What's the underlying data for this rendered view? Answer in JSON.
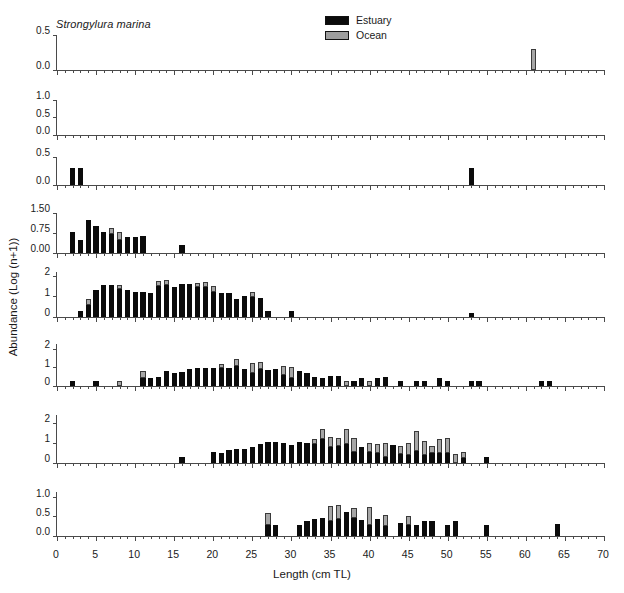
{
  "figure": {
    "species": "Strongylura marina",
    "yaxis_title": "Abundance (Log (n+1))",
    "xaxis_title": "Length (cm TL)",
    "colors": {
      "estuary": "#0b0b0b",
      "ocean": "#a6a6a6",
      "axis": "#4a4a4a"
    }
  },
  "legend": {
    "position": "top-center",
    "entries": [
      {
        "label": "Estuary",
        "icon": "filled-square-black-swatch"
      },
      {
        "label": "Ocean",
        "icon": "filled-square-gray-swatch"
      }
    ]
  },
  "xaxis": {
    "min": 0,
    "max": 70,
    "major_step": 5,
    "minor_step": 1,
    "ticks": [
      "0",
      "5",
      "10",
      "15",
      "20",
      "25",
      "30",
      "35",
      "40",
      "45",
      "50",
      "55",
      "60",
      "65",
      "70"
    ]
  },
  "chart_data": {
    "type": "bar",
    "subtype": "stacked-bar-small-multiples",
    "title": "Strongylura marina",
    "xlabel": "Length (cm TL)",
    "ylabel": "Abundance (Log (n+1))",
    "xlim": [
      0,
      70
    ],
    "grid": false,
    "legend_position": "top-center",
    "series_names": [
      "Estuary",
      "Ocean"
    ],
    "panels": [
      {
        "label": "March (n=1)",
        "month": "March",
        "n": 1,
        "ylim": [
          0,
          0.5
        ],
        "yticks": [
          "0.0",
          "0.5"
        ],
        "ytick_values": [
          0,
          0.5
        ],
        "bars": [
          {
            "x": 61,
            "estuary": 0.0,
            "ocean": 0.3
          }
        ]
      },
      {
        "label": "April (n=0)",
        "month": "April",
        "n": 0,
        "ylim": [
          0,
          1.0
        ],
        "yticks": [
          "0.0",
          "0.5",
          "1.0"
        ],
        "ytick_values": [
          0,
          0.5,
          1.0
        ],
        "bars": []
      },
      {
        "label": "May (n=3)",
        "month": "May",
        "n": 3,
        "ylim": [
          0,
          0.5
        ],
        "yticks": [
          "0.0",
          "0.5"
        ],
        "ytick_values": [
          0,
          0.5
        ],
        "bars": [
          {
            "x": 2,
            "estuary": 0.3,
            "ocean": 0.0
          },
          {
            "x": 3,
            "estuary": 0.3,
            "ocean": 0.0
          },
          {
            "x": 53,
            "estuary": 0.3,
            "ocean": 0.0
          }
        ]
      },
      {
        "label": "June (n=67)",
        "month": "June",
        "n": 67,
        "ylim": [
          0,
          1.5
        ],
        "yticks": [
          "0.00",
          "0.75",
          "1.50"
        ],
        "ytick_values": [
          0,
          0.75,
          1.5
        ],
        "bars": [
          {
            "x": 2,
            "estuary": 0.8,
            "ocean": 0.0
          },
          {
            "x": 3,
            "estuary": 0.48,
            "ocean": 0.0
          },
          {
            "x": 4,
            "estuary": 1.22,
            "ocean": 0.0
          },
          {
            "x": 5,
            "estuary": 1.0,
            "ocean": 0.0
          },
          {
            "x": 6,
            "estuary": 0.8,
            "ocean": 0.0
          },
          {
            "x": 7,
            "estuary": 0.7,
            "ocean": 0.22
          },
          {
            "x": 8,
            "estuary": 0.48,
            "ocean": 0.3
          },
          {
            "x": 9,
            "estuary": 0.6,
            "ocean": 0.0
          },
          {
            "x": 10,
            "estuary": 0.6,
            "ocean": 0.0
          },
          {
            "x": 11,
            "estuary": 0.62,
            "ocean": 0.0
          },
          {
            "x": 16,
            "estuary": 0.3,
            "ocean": 0.0
          }
        ]
      },
      {
        "label": "July (n=452)",
        "month": "July",
        "n": 452,
        "ylim": [
          0,
          2.2
        ],
        "yticks": [
          "0",
          "1",
          "2"
        ],
        "ytick_values": [
          0,
          1,
          2
        ],
        "bars": [
          {
            "x": 3,
            "estuary": 0.3,
            "ocean": 0.0
          },
          {
            "x": 4,
            "estuary": 0.6,
            "ocean": 0.3
          },
          {
            "x": 5,
            "estuary": 1.3,
            "ocean": 0.0
          },
          {
            "x": 6,
            "estuary": 1.55,
            "ocean": 0.0
          },
          {
            "x": 7,
            "estuary": 1.55,
            "ocean": 0.0
          },
          {
            "x": 8,
            "estuary": 1.35,
            "ocean": 0.22
          },
          {
            "x": 9,
            "estuary": 1.3,
            "ocean": 0.0
          },
          {
            "x": 10,
            "estuary": 1.22,
            "ocean": 0.0
          },
          {
            "x": 11,
            "estuary": 1.2,
            "ocean": 0.0
          },
          {
            "x": 12,
            "estuary": 1.15,
            "ocean": 0.0
          },
          {
            "x": 13,
            "estuary": 1.52,
            "ocean": 0.25
          },
          {
            "x": 14,
            "estuary": 1.55,
            "ocean": 0.28
          },
          {
            "x": 15,
            "estuary": 1.45,
            "ocean": 0.0
          },
          {
            "x": 16,
            "estuary": 1.62,
            "ocean": 0.0
          },
          {
            "x": 17,
            "estuary": 1.6,
            "ocean": 0.0
          },
          {
            "x": 18,
            "estuary": 1.48,
            "ocean": 0.2
          },
          {
            "x": 19,
            "estuary": 1.45,
            "ocean": 0.25
          },
          {
            "x": 20,
            "estuary": 1.22,
            "ocean": 0.3
          },
          {
            "x": 21,
            "estuary": 1.18,
            "ocean": 0.0
          },
          {
            "x": 22,
            "estuary": 1.15,
            "ocean": 0.0
          },
          {
            "x": 23,
            "estuary": 0.9,
            "ocean": 0.0
          },
          {
            "x": 24,
            "estuary": 1.05,
            "ocean": 0.0
          },
          {
            "x": 25,
            "estuary": 1.0,
            "ocean": 0.22
          },
          {
            "x": 26,
            "estuary": 0.95,
            "ocean": 0.0
          },
          {
            "x": 27,
            "estuary": 0.3,
            "ocean": 0.0
          },
          {
            "x": 30,
            "estuary": 0.3,
            "ocean": 0.0
          },
          {
            "x": 53,
            "estuary": 0.22,
            "ocean": 0.0
          }
        ]
      },
      {
        "label": "August (n=358)",
        "month": "August",
        "n": 358,
        "ylim": [
          0,
          2.3
        ],
        "yticks": [
          "0",
          "1",
          "2"
        ],
        "ytick_values": [
          0,
          1,
          2
        ],
        "bars": [
          {
            "x": 2,
            "estuary": 0.3,
            "ocean": 0.0
          },
          {
            "x": 5,
            "estuary": 0.3,
            "ocean": 0.0
          },
          {
            "x": 8,
            "estuary": 0.0,
            "ocean": 0.3
          },
          {
            "x": 11,
            "estuary": 0.42,
            "ocean": 0.38
          },
          {
            "x": 12,
            "estuary": 0.45,
            "ocean": 0.0
          },
          {
            "x": 13,
            "estuary": 0.48,
            "ocean": 0.0
          },
          {
            "x": 14,
            "estuary": 0.8,
            "ocean": 0.0
          },
          {
            "x": 15,
            "estuary": 0.72,
            "ocean": 0.0
          },
          {
            "x": 16,
            "estuary": 0.75,
            "ocean": 0.0
          },
          {
            "x": 17,
            "estuary": 0.95,
            "ocean": 0.0
          },
          {
            "x": 18,
            "estuary": 1.0,
            "ocean": 0.0
          },
          {
            "x": 19,
            "estuary": 1.0,
            "ocean": 0.0
          },
          {
            "x": 20,
            "estuary": 1.0,
            "ocean": 0.0
          },
          {
            "x": 21,
            "estuary": 1.0,
            "ocean": 0.22
          },
          {
            "x": 22,
            "estuary": 1.0,
            "ocean": 0.0
          },
          {
            "x": 23,
            "estuary": 1.12,
            "ocean": 0.35
          },
          {
            "x": 24,
            "estuary": 0.95,
            "ocean": 0.0
          },
          {
            "x": 25,
            "estuary": 0.72,
            "ocean": 0.52
          },
          {
            "x": 26,
            "estuary": 0.92,
            "ocean": 0.4
          },
          {
            "x": 27,
            "estuary": 0.9,
            "ocean": 0.0
          },
          {
            "x": 28,
            "estuary": 0.95,
            "ocean": 0.0
          },
          {
            "x": 29,
            "estuary": 0.6,
            "ocean": 0.48
          },
          {
            "x": 30,
            "estuary": 0.45,
            "ocean": 0.6
          },
          {
            "x": 31,
            "estuary": 0.8,
            "ocean": 0.0
          },
          {
            "x": 32,
            "estuary": 0.7,
            "ocean": 0.0
          },
          {
            "x": 33,
            "estuary": 0.52,
            "ocean": 0.0
          },
          {
            "x": 34,
            "estuary": 0.42,
            "ocean": 0.0
          },
          {
            "x": 35,
            "estuary": 0.55,
            "ocean": 0.0
          },
          {
            "x": 36,
            "estuary": 0.55,
            "ocean": 0.0
          },
          {
            "x": 37,
            "estuary": 0.0,
            "ocean": 0.3
          },
          {
            "x": 38,
            "estuary": 0.3,
            "ocean": 0.0
          },
          {
            "x": 39,
            "estuary": 0.45,
            "ocean": 0.0
          },
          {
            "x": 40,
            "estuary": 0.0,
            "ocean": 0.3
          },
          {
            "x": 41,
            "estuary": 0.45,
            "ocean": 0.0
          },
          {
            "x": 42,
            "estuary": 0.48,
            "ocean": 0.0
          },
          {
            "x": 44,
            "estuary": 0.3,
            "ocean": 0.0
          },
          {
            "x": 46,
            "estuary": 0.3,
            "ocean": 0.0
          },
          {
            "x": 47,
            "estuary": 0.3,
            "ocean": 0.0
          },
          {
            "x": 49,
            "estuary": 0.42,
            "ocean": 0.0
          },
          {
            "x": 50,
            "estuary": 0.3,
            "ocean": 0.0
          },
          {
            "x": 53,
            "estuary": 0.3,
            "ocean": 0.0
          },
          {
            "x": 54,
            "estuary": 0.3,
            "ocean": 0.0
          },
          {
            "x": 62,
            "estuary": 0.3,
            "ocean": 0.0
          },
          {
            "x": 63,
            "estuary": 0.3,
            "ocean": 0.0
          }
        ]
      },
      {
        "label": "September (n=305)",
        "month": "September",
        "n": 305,
        "ylim": [
          0,
          2.4
        ],
        "yticks": [
          "0",
          "1",
          "2"
        ],
        "ytick_values": [
          0,
          1,
          2
        ],
        "bars": [
          {
            "x": 16,
            "estuary": 0.3,
            "ocean": 0.0
          },
          {
            "x": 20,
            "estuary": 0.55,
            "ocean": 0.0
          },
          {
            "x": 21,
            "estuary": 0.48,
            "ocean": 0.0
          },
          {
            "x": 22,
            "estuary": 0.65,
            "ocean": 0.0
          },
          {
            "x": 23,
            "estuary": 0.72,
            "ocean": 0.0
          },
          {
            "x": 24,
            "estuary": 0.7,
            "ocean": 0.0
          },
          {
            "x": 25,
            "estuary": 0.8,
            "ocean": 0.0
          },
          {
            "x": 26,
            "estuary": 0.95,
            "ocean": 0.0
          },
          {
            "x": 27,
            "estuary": 1.05,
            "ocean": 0.0
          },
          {
            "x": 28,
            "estuary": 1.05,
            "ocean": 0.0
          },
          {
            "x": 29,
            "estuary": 1.0,
            "ocean": 0.0
          },
          {
            "x": 30,
            "estuary": 0.9,
            "ocean": 0.0
          },
          {
            "x": 31,
            "estuary": 1.05,
            "ocean": 0.0
          },
          {
            "x": 32,
            "estuary": 1.0,
            "ocean": 0.0
          },
          {
            "x": 33,
            "estuary": 0.95,
            "ocean": 0.25
          },
          {
            "x": 34,
            "estuary": 1.2,
            "ocean": 0.52
          },
          {
            "x": 35,
            "estuary": 0.8,
            "ocean": 0.52
          },
          {
            "x": 36,
            "estuary": 0.85,
            "ocean": 0.38
          },
          {
            "x": 37,
            "estuary": 0.95,
            "ocean": 0.75
          },
          {
            "x": 38,
            "estuary": 0.55,
            "ocean": 0.68
          },
          {
            "x": 39,
            "estuary": 0.8,
            "ocean": 0.0
          },
          {
            "x": 40,
            "estuary": 0.55,
            "ocean": 0.45
          },
          {
            "x": 41,
            "estuary": 0.52,
            "ocean": 0.42
          },
          {
            "x": 42,
            "estuary": 0.3,
            "ocean": 0.72
          },
          {
            "x": 43,
            "estuary": 0.9,
            "ocean": 0.0
          },
          {
            "x": 44,
            "estuary": 0.45,
            "ocean": 0.4
          },
          {
            "x": 45,
            "estuary": 0.42,
            "ocean": 0.58
          },
          {
            "x": 46,
            "estuary": 0.58,
            "ocean": 1.0
          },
          {
            "x": 47,
            "estuary": 0.4,
            "ocean": 0.72
          },
          {
            "x": 48,
            "estuary": 0.48,
            "ocean": 0.38
          },
          {
            "x": 49,
            "estuary": 0.48,
            "ocean": 0.7
          },
          {
            "x": 50,
            "estuary": 0.52,
            "ocean": 0.75
          },
          {
            "x": 51,
            "estuary": 0.0,
            "ocean": 0.45
          },
          {
            "x": 52,
            "estuary": 0.25,
            "ocean": 0.3
          },
          {
            "x": 55,
            "estuary": 0.32,
            "ocean": 0.0
          }
        ]
      },
      {
        "label": "October (n=68)",
        "month": "October",
        "n": 68,
        "ylim": [
          0,
          1.15
        ],
        "yticks": [
          "0.0",
          "0.5",
          "1.0"
        ],
        "ytick_values": [
          0,
          0.5,
          1.0
        ],
        "bars": [
          {
            "x": 27,
            "estuary": 0.3,
            "ocean": 0.3
          },
          {
            "x": 28,
            "estuary": 0.3,
            "ocean": 0.0
          },
          {
            "x": 31,
            "estuary": 0.3,
            "ocean": 0.0
          },
          {
            "x": 32,
            "estuary": 0.4,
            "ocean": 0.0
          },
          {
            "x": 33,
            "estuary": 0.45,
            "ocean": 0.0
          },
          {
            "x": 34,
            "estuary": 0.48,
            "ocean": 0.0
          },
          {
            "x": 35,
            "estuary": 0.4,
            "ocean": 0.38
          },
          {
            "x": 36,
            "estuary": 0.45,
            "ocean": 0.35
          },
          {
            "x": 37,
            "estuary": 0.62,
            "ocean": 0.0
          },
          {
            "x": 38,
            "estuary": 0.48,
            "ocean": 0.25
          },
          {
            "x": 39,
            "estuary": 0.42,
            "ocean": 0.0
          },
          {
            "x": 40,
            "estuary": 0.3,
            "ocean": 0.45
          },
          {
            "x": 41,
            "estuary": 0.45,
            "ocean": 0.0
          },
          {
            "x": 42,
            "estuary": 0.25,
            "ocean": 0.3
          },
          {
            "x": 44,
            "estuary": 0.35,
            "ocean": 0.0
          },
          {
            "x": 45,
            "estuary": 0.3,
            "ocean": 0.22
          },
          {
            "x": 46,
            "estuary": 0.3,
            "ocean": 0.0
          },
          {
            "x": 47,
            "estuary": 0.38,
            "ocean": 0.0
          },
          {
            "x": 48,
            "estuary": 0.38,
            "ocean": 0.0
          },
          {
            "x": 50,
            "estuary": 0.3,
            "ocean": 0.0
          },
          {
            "x": 51,
            "estuary": 0.38,
            "ocean": 0.0
          },
          {
            "x": 55,
            "estuary": 0.3,
            "ocean": 0.0
          },
          {
            "x": 64,
            "estuary": 0.32,
            "ocean": 0.0
          }
        ]
      }
    ]
  }
}
